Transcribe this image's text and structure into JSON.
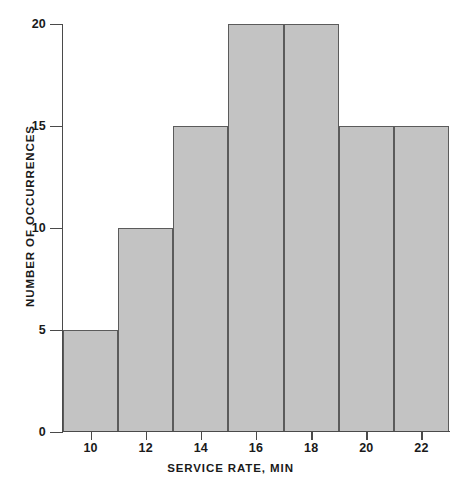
{
  "chart_data": {
    "type": "bar",
    "title": "",
    "subtitle": "",
    "xlabel": "SERVICE RATE, MIN",
    "ylabel": "NUMBER OF OCCURRENCES",
    "xlim": [
      9,
      23
    ],
    "ylim": [
      0,
      20
    ],
    "grid": false,
    "legend": null,
    "x_tick_labels": [
      "10",
      "12",
      "14",
      "16",
      "18",
      "20",
      "22"
    ],
    "x_tick_values": [
      10,
      12,
      14,
      16,
      18,
      20,
      22
    ],
    "y_tick_labels": [
      "0",
      "5",
      "10",
      "15",
      "20"
    ],
    "y_tick_values": [
      0,
      5,
      10,
      15,
      20
    ],
    "bin_width": 2,
    "categories": [
      "9-11",
      "11-13",
      "13-15",
      "15-17",
      "17-19",
      "19-21",
      "21-23"
    ],
    "values": [
      5,
      10,
      15,
      20,
      20,
      15,
      15
    ],
    "bins": [
      {
        "label": "9-11",
        "start": 9,
        "end": 11,
        "value": 5
      },
      {
        "label": "11-13",
        "start": 11,
        "end": 13,
        "value": 10
      },
      {
        "label": "13-15",
        "start": 13,
        "end": 15,
        "value": 15
      },
      {
        "label": "15-17",
        "start": 15,
        "end": 17,
        "value": 20
      },
      {
        "label": "17-19",
        "start": 17,
        "end": 19,
        "value": 20
      },
      {
        "label": "19-21",
        "start": 19,
        "end": 21,
        "value": 15
      },
      {
        "label": "21-23",
        "start": 21,
        "end": 23,
        "value": 15
      }
    ],
    "colors": {
      "bar_fill": "#c3c3c3",
      "bar_stroke": "#5b5b5b",
      "axis": "#4a4a4a",
      "text": "#1a1a1a",
      "background": "#ffffff"
    }
  }
}
